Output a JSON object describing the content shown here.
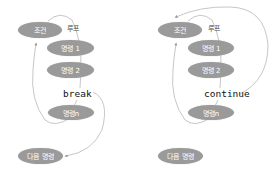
{
  "diagrams": [
    {
      "id": "break",
      "nodes": {
        "condition": "조건",
        "cmd1": "명령 1",
        "cmd2": "명령 2",
        "cmdn": "명령n",
        "next": "다음 명령"
      },
      "loop_label": "루프",
      "keyword": "break"
    },
    {
      "id": "continue",
      "nodes": {
        "condition": "조건",
        "cmd1": "명령 1",
        "cmd2": "명령 2",
        "cmdn": "명령n",
        "next": "다음 명령"
      },
      "loop_label": "루프",
      "keyword": "continue"
    }
  ],
  "colors": {
    "node_fill": "#9a9a9a",
    "node_text": "#ffffff",
    "line": "#b0b0b0"
  }
}
